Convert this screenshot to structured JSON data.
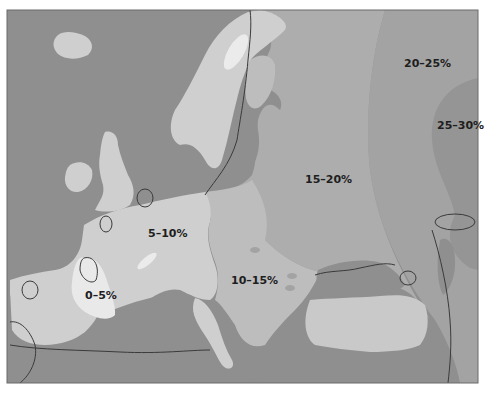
{
  "map": {
    "title": "",
    "region": "Europe",
    "zones": [
      {
        "label": "0–5%",
        "shade": "#e9e9e9"
      },
      {
        "label": "5–10%",
        "shade": "#cfcfcf"
      },
      {
        "label": "10–15%",
        "shade": "#bdbdbd"
      },
      {
        "label": "15–20%",
        "shade": "#adadad"
      },
      {
        "label": "20–25%",
        "shade": "#a3a3a3"
      },
      {
        "label": "25–30%",
        "shade": "#959595"
      }
    ],
    "colors": {
      "sea": "#8f8f8f",
      "frame": "#6a6a6a",
      "contour": "#3a3a3a",
      "background": "#ffffff"
    }
  }
}
